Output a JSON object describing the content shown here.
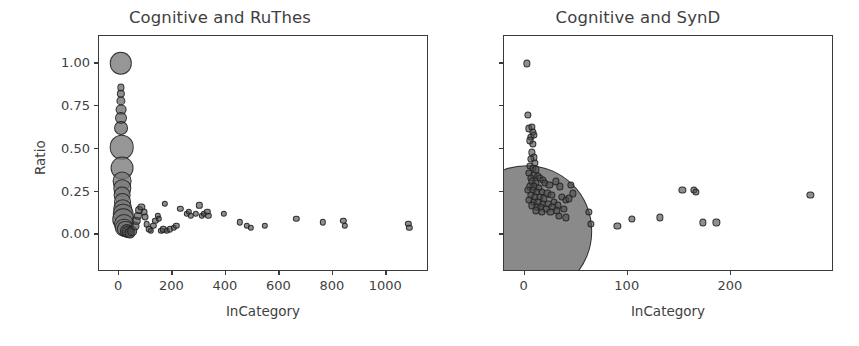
{
  "figure": {
    "width": 859,
    "height": 346,
    "background": "#ffffff",
    "marker_color": "#4a4a4a",
    "marker_edge_color": "#202020",
    "axis_color": "#3a3a3a",
    "text_color": "#3f3f3f"
  },
  "chart_data": [
    {
      "type": "scatter",
      "title": "Cognitive and RuThes",
      "xlabel": "InCategory",
      "ylabel": "Ratio",
      "xlim": [
        -75,
        1160
      ],
      "ylim": [
        -0.22,
        1.16
      ],
      "xticks": [
        0,
        200,
        400,
        600,
        800,
        1000
      ],
      "xticklabels": [
        "0",
        "200",
        "400",
        "600",
        "800",
        "1000"
      ],
      "yticks": [
        0.0,
        0.25,
        0.5,
        0.75,
        1.0
      ],
      "yticklabels": [
        "0.00",
        "0.25",
        "0.50",
        "0.75",
        "1.00"
      ],
      "grid": false,
      "legend": null,
      "size_encoding": "marker area proportional to category frequency",
      "points": [
        {
          "x": 6,
          "y": 1.0,
          "s": 250
        },
        {
          "x": 6,
          "y": 0.86,
          "s": 26
        },
        {
          "x": 7,
          "y": 0.82,
          "s": 34
        },
        {
          "x": 7,
          "y": 0.78,
          "s": 42
        },
        {
          "x": 8,
          "y": 0.73,
          "s": 58
        },
        {
          "x": 8,
          "y": 0.68,
          "s": 72
        },
        {
          "x": 9,
          "y": 0.62,
          "s": 96
        },
        {
          "x": 10,
          "y": 0.51,
          "s": 300
        },
        {
          "x": 11,
          "y": 0.39,
          "s": 260
        },
        {
          "x": 11,
          "y": 0.31,
          "s": 175
        },
        {
          "x": 12,
          "y": 0.27,
          "s": 150
        },
        {
          "x": 12,
          "y": 0.23,
          "s": 140
        },
        {
          "x": 13,
          "y": 0.19,
          "s": 160
        },
        {
          "x": 14,
          "y": 0.15,
          "s": 190
        },
        {
          "x": 15,
          "y": 0.12,
          "s": 210
        },
        {
          "x": 16,
          "y": 0.09,
          "s": 230
        },
        {
          "x": 18,
          "y": 0.06,
          "s": 200
        },
        {
          "x": 20,
          "y": 0.04,
          "s": 170
        },
        {
          "x": 24,
          "y": 0.03,
          "s": 130
        },
        {
          "x": 28,
          "y": 0.02,
          "s": 100
        },
        {
          "x": 34,
          "y": 0.015,
          "s": 80
        },
        {
          "x": 42,
          "y": 0.01,
          "s": 60
        },
        {
          "x": 50,
          "y": 0.02,
          "s": 46
        },
        {
          "x": 58,
          "y": 0.05,
          "s": 40
        },
        {
          "x": 64,
          "y": 0.08,
          "s": 36
        },
        {
          "x": 70,
          "y": 0.11,
          "s": 34
        },
        {
          "x": 76,
          "y": 0.14,
          "s": 30
        },
        {
          "x": 84,
          "y": 0.16,
          "s": 26
        },
        {
          "x": 92,
          "y": 0.13,
          "s": 24
        },
        {
          "x": 98,
          "y": 0.1,
          "s": 24
        },
        {
          "x": 104,
          "y": 0.06,
          "s": 22
        },
        {
          "x": 112,
          "y": 0.03,
          "s": 22
        },
        {
          "x": 120,
          "y": 0.02,
          "s": 20
        },
        {
          "x": 128,
          "y": 0.05,
          "s": 20
        },
        {
          "x": 136,
          "y": 0.08,
          "s": 20
        },
        {
          "x": 146,
          "y": 0.11,
          "s": 20
        },
        {
          "x": 150,
          "y": 0.09,
          "s": 20
        },
        {
          "x": 158,
          "y": 0.02,
          "s": 20
        },
        {
          "x": 166,
          "y": 0.03,
          "s": 20
        },
        {
          "x": 172,
          "y": 0.18,
          "s": 20
        },
        {
          "x": 180,
          "y": 0.02,
          "s": 20
        },
        {
          "x": 190,
          "y": 0.03,
          "s": 20
        },
        {
          "x": 206,
          "y": 0.04,
          "s": 20
        },
        {
          "x": 214,
          "y": 0.05,
          "s": 20
        },
        {
          "x": 230,
          "y": 0.15,
          "s": 20
        },
        {
          "x": 254,
          "y": 0.12,
          "s": 20
        },
        {
          "x": 262,
          "y": 0.13,
          "s": 20
        },
        {
          "x": 268,
          "y": 0.11,
          "s": 20
        },
        {
          "x": 288,
          "y": 0.12,
          "s": 20
        },
        {
          "x": 300,
          "y": 0.17,
          "s": 20
        },
        {
          "x": 310,
          "y": 0.11,
          "s": 20
        },
        {
          "x": 318,
          "y": 0.12,
          "s": 20
        },
        {
          "x": 330,
          "y": 0.13,
          "s": 20
        },
        {
          "x": 334,
          "y": 0.11,
          "s": 20
        },
        {
          "x": 392,
          "y": 0.12,
          "s": 20
        },
        {
          "x": 452,
          "y": 0.07,
          "s": 20
        },
        {
          "x": 478,
          "y": 0.05,
          "s": 20
        },
        {
          "x": 492,
          "y": 0.04,
          "s": 20
        },
        {
          "x": 546,
          "y": 0.05,
          "s": 20
        },
        {
          "x": 664,
          "y": 0.09,
          "s": 20
        },
        {
          "x": 762,
          "y": 0.07,
          "s": 20
        },
        {
          "x": 840,
          "y": 0.08,
          "s": 20
        },
        {
          "x": 846,
          "y": 0.05,
          "s": 20
        },
        {
          "x": 1082,
          "y": 0.06,
          "s": 20
        },
        {
          "x": 1086,
          "y": 0.04,
          "s": 20
        }
      ]
    },
    {
      "type": "scatter",
      "title": "Cognitive and SynD",
      "xlabel": "InCategory",
      "ylabel": "",
      "xlim": [
        -20,
        300
      ],
      "ylim": [
        -0.22,
        1.16
      ],
      "xticks": [
        0,
        100,
        200
      ],
      "xticklabels": [
        "0",
        "100",
        "200"
      ],
      "yticks": [
        0.0,
        0.25,
        0.5,
        0.75,
        1.0
      ],
      "yticklabels": [
        "",
        "",
        "",
        "",
        ""
      ],
      "grid": false,
      "legend": null,
      "size_encoding": "marker area proportional to category frequency",
      "points": [
        {
          "x": 2,
          "y": 0.02,
          "s": 8600
        },
        {
          "x": 2,
          "y": 1.0,
          "s": 26
        },
        {
          "x": 3,
          "y": 0.7,
          "s": 26
        },
        {
          "x": 4,
          "y": 0.62,
          "s": 26
        },
        {
          "x": 7,
          "y": 0.63,
          "s": 26
        },
        {
          "x": 8,
          "y": 0.6,
          "s": 26
        },
        {
          "x": 6,
          "y": 0.57,
          "s": 26
        },
        {
          "x": 9,
          "y": 0.58,
          "s": 26
        },
        {
          "x": 5,
          "y": 0.55,
          "s": 26
        },
        {
          "x": 8,
          "y": 0.53,
          "s": 26
        },
        {
          "x": 7,
          "y": 0.48,
          "s": 26
        },
        {
          "x": 9,
          "y": 0.45,
          "s": 26
        },
        {
          "x": 6,
          "y": 0.44,
          "s": 26
        },
        {
          "x": 10,
          "y": 0.42,
          "s": 26
        },
        {
          "x": 5,
          "y": 0.4,
          "s": 26
        },
        {
          "x": 8,
          "y": 0.39,
          "s": 26
        },
        {
          "x": 11,
          "y": 0.38,
          "s": 26
        },
        {
          "x": 4,
          "y": 0.36,
          "s": 26
        },
        {
          "x": 9,
          "y": 0.35,
          "s": 26
        },
        {
          "x": 13,
          "y": 0.34,
          "s": 26
        },
        {
          "x": 6,
          "y": 0.33,
          "s": 26
        },
        {
          "x": 15,
          "y": 0.33,
          "s": 26
        },
        {
          "x": 18,
          "y": 0.32,
          "s": 26
        },
        {
          "x": 7,
          "y": 0.31,
          "s": 26
        },
        {
          "x": 11,
          "y": 0.3,
          "s": 26
        },
        {
          "x": 20,
          "y": 0.3,
          "s": 26
        },
        {
          "x": 5,
          "y": 0.28,
          "s": 26
        },
        {
          "x": 9,
          "y": 0.28,
          "s": 26
        },
        {
          "x": 14,
          "y": 0.27,
          "s": 26
        },
        {
          "x": 24,
          "y": 0.29,
          "s": 26
        },
        {
          "x": 3,
          "y": 0.26,
          "s": 26
        },
        {
          "x": 8,
          "y": 0.26,
          "s": 26
        },
        {
          "x": 12,
          "y": 0.25,
          "s": 26
        },
        {
          "x": 17,
          "y": 0.25,
          "s": 26
        },
        {
          "x": 22,
          "y": 0.24,
          "s": 26
        },
        {
          "x": 30,
          "y": 0.31,
          "s": 26
        },
        {
          "x": 6,
          "y": 0.23,
          "s": 26
        },
        {
          "x": 10,
          "y": 0.22,
          "s": 26
        },
        {
          "x": 15,
          "y": 0.22,
          "s": 26
        },
        {
          "x": 19,
          "y": 0.21,
          "s": 26
        },
        {
          "x": 26,
          "y": 0.23,
          "s": 26
        },
        {
          "x": 34,
          "y": 0.28,
          "s": 26
        },
        {
          "x": 4,
          "y": 0.2,
          "s": 26
        },
        {
          "x": 9,
          "y": 0.19,
          "s": 26
        },
        {
          "x": 13,
          "y": 0.19,
          "s": 26
        },
        {
          "x": 18,
          "y": 0.18,
          "s": 26
        },
        {
          "x": 23,
          "y": 0.18,
          "s": 26
        },
        {
          "x": 28,
          "y": 0.19,
          "s": 26
        },
        {
          "x": 36,
          "y": 0.22,
          "s": 26
        },
        {
          "x": 45,
          "y": 0.29,
          "s": 26
        },
        {
          "x": 7,
          "y": 0.17,
          "s": 26
        },
        {
          "x": 12,
          "y": 0.16,
          "s": 26
        },
        {
          "x": 16,
          "y": 0.16,
          "s": 26
        },
        {
          "x": 21,
          "y": 0.15,
          "s": 26
        },
        {
          "x": 27,
          "y": 0.16,
          "s": 26
        },
        {
          "x": 32,
          "y": 0.17,
          "s": 26
        },
        {
          "x": 40,
          "y": 0.2,
          "s": 26
        },
        {
          "x": 47,
          "y": 0.24,
          "s": 26
        },
        {
          "x": 11,
          "y": 0.14,
          "s": 26
        },
        {
          "x": 17,
          "y": 0.13,
          "s": 26
        },
        {
          "x": 25,
          "y": 0.13,
          "s": 26
        },
        {
          "x": 31,
          "y": 0.14,
          "s": 26
        },
        {
          "x": 38,
          "y": 0.15,
          "s": 26
        },
        {
          "x": 43,
          "y": 0.21,
          "s": 26
        },
        {
          "x": 33,
          "y": 0.11,
          "s": 26
        },
        {
          "x": 40,
          "y": 0.1,
          "s": 26
        },
        {
          "x": 62,
          "y": 0.13,
          "s": 26
        },
        {
          "x": 64,
          "y": 0.06,
          "s": 26
        },
        {
          "x": 90,
          "y": 0.05,
          "s": 26
        },
        {
          "x": 104,
          "y": 0.09,
          "s": 26
        },
        {
          "x": 131,
          "y": 0.1,
          "s": 26
        },
        {
          "x": 153,
          "y": 0.26,
          "s": 26
        },
        {
          "x": 164,
          "y": 0.26,
          "s": 26
        },
        {
          "x": 166,
          "y": 0.25,
          "s": 26
        },
        {
          "x": 173,
          "y": 0.07,
          "s": 26
        },
        {
          "x": 186,
          "y": 0.07,
          "s": 26
        },
        {
          "x": 277,
          "y": 0.23,
          "s": 26
        }
      ]
    }
  ]
}
